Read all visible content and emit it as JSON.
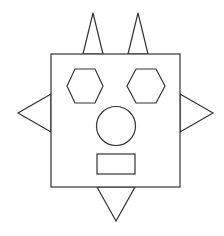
{
  "canvas": {
    "width": 224,
    "height": 236,
    "background": "#ffffff"
  },
  "style": {
    "stroke": "#333333",
    "fill": "#ffffff",
    "stroke_width": 1.2
  },
  "figure": {
    "spikes": {
      "top_left": {
        "points": "83,54 93,13 103,54"
      },
      "top_right": {
        "points": "128,54 138,13 148,54"
      },
      "left": {
        "points": "51,94 18,113 51,132"
      },
      "right": {
        "points": "180,94 213,113 180,132"
      },
      "bottom": {
        "points": "97,187 116,221 135,187"
      }
    },
    "head": {
      "x": 51,
      "y": 54,
      "width": 129,
      "height": 133
    },
    "eyes": {
      "left": {
        "points": "75,69 95,69 103,86 95,103 75,103 67,86"
      },
      "right": {
        "points": "136,69 156,69 165,86 156,103 136,103 127,86"
      }
    },
    "nose": {
      "cx": 116,
      "cy": 126,
      "r": 19.5
    },
    "mouth": {
      "x": 97,
      "y": 154,
      "width": 38,
      "height": 20
    }
  }
}
